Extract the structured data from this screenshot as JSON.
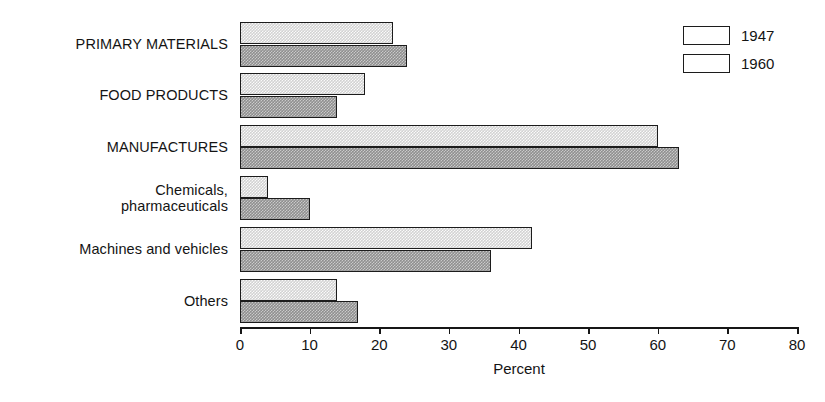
{
  "chart_data": {
    "type": "bar",
    "orientation": "horizontal",
    "title": "",
    "xlabel": "Percent",
    "ylabel": "",
    "xlim": [
      0,
      80
    ],
    "xticks": [
      0,
      10,
      20,
      30,
      40,
      50,
      60,
      70,
      80
    ],
    "grid": false,
    "legend_position": "top-right",
    "categories": [
      "PRIMARY MATERIALS",
      "FOOD PRODUCTS",
      "MANUFACTURES",
      "Chemicals,\npharmaceuticals",
      "Machines and vehicles",
      "Others"
    ],
    "series": [
      {
        "name": "1947",
        "color": "#d2d2d2",
        "values": [
          22,
          18,
          60,
          4,
          42,
          14
        ]
      },
      {
        "name": "1960",
        "color": "#8f8f8f",
        "values": [
          24,
          14,
          63,
          10,
          36,
          17
        ]
      }
    ]
  },
  "legend": {
    "entries": [
      {
        "label": "1947"
      },
      {
        "label": "1960"
      }
    ]
  },
  "axis": {
    "tick_labels": [
      "0",
      "10",
      "20",
      "30",
      "40",
      "50",
      "60",
      "70",
      "80"
    ],
    "title": "Percent"
  }
}
